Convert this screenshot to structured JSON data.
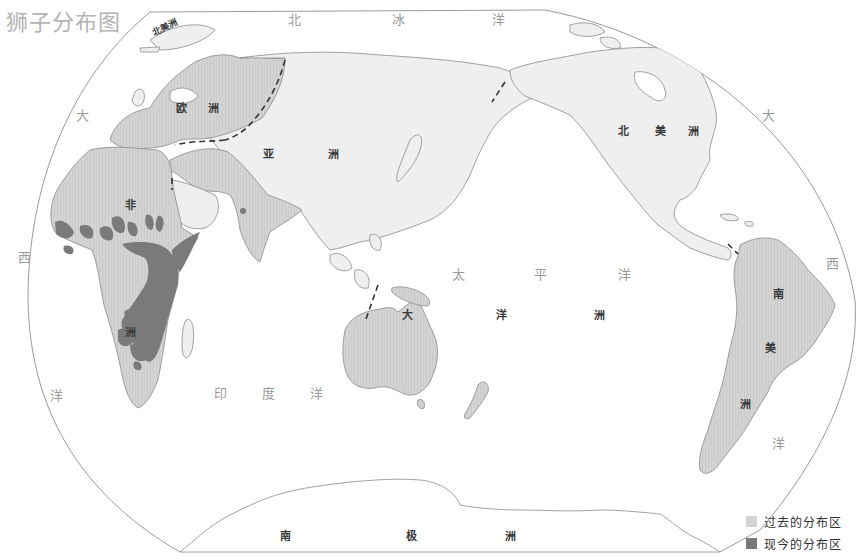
{
  "title": "狮子分布图",
  "colors": {
    "past_range": "#d3d3d3",
    "current_range": "#7a7a7a",
    "land_other": "#efefef",
    "coast_line": "#8a8a8a",
    "border_dash": "#333333",
    "ocean": "#ffffff"
  },
  "oceans": {
    "arctic": [
      "北",
      "冰",
      "洋"
    ],
    "atlantic_west": [
      "大",
      "西",
      "洋"
    ],
    "atlantic_east": [
      "大",
      "西",
      "洋"
    ],
    "pacific": [
      "太",
      "平",
      "洋"
    ],
    "indian": [
      "印",
      "度",
      "洋"
    ]
  },
  "continents": {
    "europe": [
      "欧",
      "洲"
    ],
    "asia": [
      "亚",
      "洲"
    ],
    "africa": [
      "非",
      "洲"
    ],
    "north_america": [
      "北",
      "美",
      "洲"
    ],
    "north_america_small": "北美洲",
    "south_america": [
      "南",
      "美",
      "洲"
    ],
    "oceania": [
      "大",
      "洋",
      "洲"
    ],
    "antarctica": [
      "南",
      "极",
      "洲"
    ]
  },
  "legend": {
    "items": [
      {
        "label": "过去的分布区",
        "color": "#d3d3d3"
      },
      {
        "label": "现今的分布区",
        "color": "#7a7a7a"
      }
    ]
  }
}
